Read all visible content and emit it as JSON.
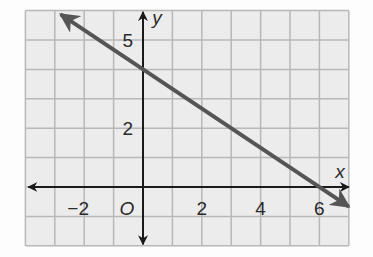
{
  "chart_data": {
    "type": "line",
    "title": "",
    "xlabel": "x",
    "ylabel": "y",
    "origin_label": "O",
    "x_ticks": [
      {
        "v": -2,
        "label": "−2"
      },
      {
        "v": 2,
        "label": "2"
      },
      {
        "v": 4,
        "label": "4"
      },
      {
        "v": 6,
        "label": "6"
      }
    ],
    "y_ticks": [
      {
        "v": 2,
        "label": "2"
      },
      {
        "v": 5,
        "label": "5"
      }
    ],
    "xlim": [
      -4,
      7
    ],
    "ylim": [
      -2,
      6
    ],
    "grid": true,
    "series": [
      {
        "name": "line",
        "equation": "y = -2/3 x + 4",
        "x": [
          -2.8,
          0,
          6,
          7
        ],
        "y": [
          5.87,
          4,
          0,
          -0.67
        ],
        "color": "#555555"
      }
    ],
    "legend": null
  },
  "colors": {
    "grid": "#b8b8b8",
    "grid_bg": "#ececec",
    "axis": "#1a1a1a",
    "line": "#555555"
  }
}
